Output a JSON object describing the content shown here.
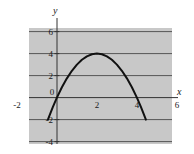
{
  "chart_data": {
    "type": "line",
    "title": "",
    "subtitle": "",
    "xlabel": "x",
    "ylabel": "y",
    "xlim": [
      -2,
      6
    ],
    "ylim": [
      -4,
      6
    ],
    "xticks": [
      -2,
      0,
      2,
      4,
      6
    ],
    "xtick_labels": [
      "-2",
      "0",
      "2",
      "4",
      "6"
    ],
    "yticks": [
      -4,
      -2,
      0,
      2,
      4,
      6
    ],
    "ytick_labels": [
      "-4",
      "-2",
      "0",
      "2",
      "4",
      "6"
    ],
    "grid": true,
    "grid_axis": "y",
    "legend": false,
    "plot_background": "#c8c8c8",
    "grid_color": "#555555",
    "axis_color": "#333333",
    "curve_color": "#111111",
    "series": [
      {
        "name": "parabola",
        "equation": "y = -x^2 + 4x",
        "vertex": [
          2,
          4
        ],
        "roots": [
          0,
          4
        ],
        "domain": [
          -0.45,
          4.45
        ],
        "x": [
          -0.45,
          -0.2,
          0,
          0.25,
          0.5,
          0.75,
          1,
          1.25,
          1.5,
          1.75,
          2,
          2.25,
          2.5,
          2.75,
          3,
          3.25,
          3.5,
          3.75,
          4,
          4.2,
          4.45
        ],
        "values": [
          -2.0,
          -0.84,
          0,
          0.94,
          1.75,
          2.44,
          3,
          3.44,
          3.75,
          3.94,
          4,
          3.94,
          3.75,
          3.44,
          3,
          2.44,
          1.75,
          0.94,
          0,
          -0.84,
          -2.0
        ]
      }
    ]
  },
  "axis_labels": {
    "x": "x",
    "y": "y"
  }
}
